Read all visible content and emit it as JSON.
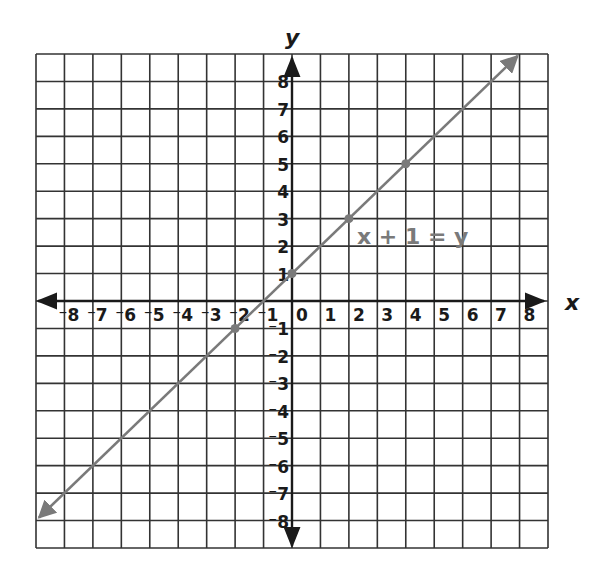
{
  "chart_data": {
    "type": "line",
    "title": "",
    "xlabel": "x",
    "ylabel": "y",
    "xlim": [
      -9,
      9
    ],
    "ylim": [
      -9,
      9
    ],
    "grid": true,
    "x_ticks": [
      "-8",
      "-7",
      "-6",
      "-5",
      "-4",
      "-3",
      "-2",
      "-1",
      "0",
      "1",
      "2",
      "3",
      "4",
      "5",
      "6",
      "7",
      "8"
    ],
    "y_ticks": [
      "8",
      "7",
      "6",
      "5",
      "4",
      "3",
      "2",
      "1",
      "-1",
      "-2",
      "-3",
      "-4",
      "-5",
      "-6",
      "-7",
      "-8"
    ],
    "series": [
      {
        "name": "x + 1 = y",
        "equation": "x + 1 = y",
        "line_from": [
          -9,
          -8
        ],
        "line_to": [
          8,
          9
        ],
        "points": [
          {
            "x": -2,
            "y": -1
          },
          {
            "x": 0,
            "y": 1
          },
          {
            "x": 2,
            "y": 3
          },
          {
            "x": 4,
            "y": 5
          }
        ]
      }
    ],
    "annotation": {
      "text": "x + 1 = y",
      "x": 2.3,
      "y": 2.2
    }
  },
  "colors": {
    "grid": "#333333",
    "axis": "#1a1a1a",
    "line": "#7a7a7a",
    "label": "#1a1a1a"
  }
}
